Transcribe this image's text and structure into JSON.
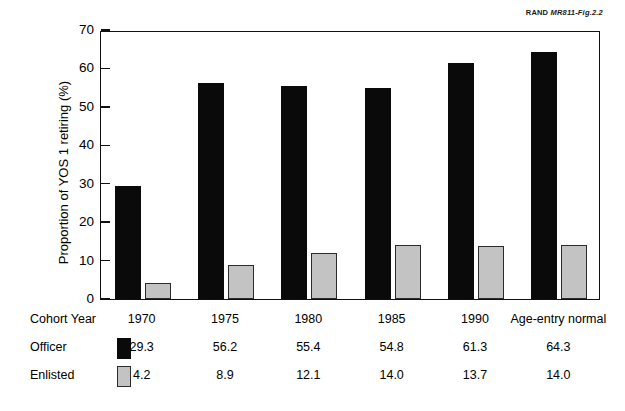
{
  "source_note": {
    "prefix": "RAND ",
    "figure_id": "MR811-Fig.2.2"
  },
  "chart_data": {
    "type": "bar",
    "title": "",
    "subtitle": "",
    "xlabel": "Cohort Year",
    "ylabel": "Proportion of YOS 1 retiring (%)",
    "ylim": [
      0,
      70
    ],
    "ytick_step": 10,
    "yticks": [
      0,
      10,
      20,
      30,
      40,
      50,
      60,
      70
    ],
    "ytick_labels": [
      "0",
      "10",
      "20",
      "30",
      "40",
      "50",
      "60",
      "70"
    ],
    "grid": false,
    "legend_position": "bottom-table",
    "categories": [
      "1970",
      "1975",
      "1980",
      "1985",
      "1990",
      "Age-entry normal"
    ],
    "series": [
      {
        "name": "Officer",
        "color": "#0a0a0a",
        "values": [
          29.3,
          56.2,
          55.4,
          54.8,
          61.3,
          64.3
        ],
        "value_labels": [
          "29.3",
          "56.2",
          "55.4",
          "54.8",
          "61.3",
          "64.3"
        ]
      },
      {
        "name": "Enlisted",
        "color": "#c3c3c3",
        "values": [
          4.2,
          8.9,
          12.1,
          14.0,
          13.7,
          14.0
        ],
        "value_labels": [
          "4.2",
          "8.9",
          "12.1",
          "14.0",
          "13.7",
          "14.0"
        ]
      }
    ]
  },
  "table": {
    "header_label": "Cohort Year",
    "columns": [
      "1970",
      "1975",
      "1980",
      "1985",
      "1990",
      "Age-entry normal"
    ],
    "rows": [
      {
        "label": "Officer",
        "swatch": "black-filled-square",
        "values": [
          "29.3",
          "56.2",
          "55.4",
          "54.8",
          "61.3",
          "64.3"
        ]
      },
      {
        "label": "Enlisted",
        "swatch": "gray-outlined-square",
        "values": [
          "4.2",
          "8.9",
          "12.1",
          "14.0",
          "13.7",
          "14.0"
        ]
      }
    ]
  }
}
